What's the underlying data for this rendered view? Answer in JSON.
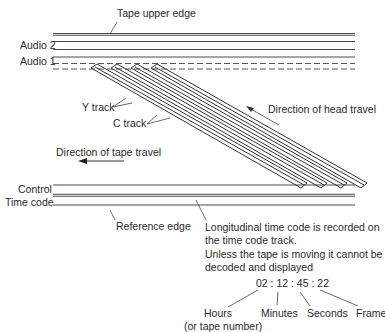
{
  "diagram": {
    "labels": {
      "tape_upper_edge": "Tape upper edge",
      "audio2": "Audio 2",
      "audio1": "Audio 1",
      "y_track": "Y  track",
      "c_track": "C  track",
      "head_travel": "Direction of head travel",
      "tape_travel": "Direction of tape travel",
      "control": "Control",
      "time_code": "Time code",
      "reference_edge": "Reference edge",
      "note_line1": "Longitudinal time code is recorded on",
      "note_line2": "the time code track.",
      "note_line3": "Unless the tape is moving it cannot be",
      "note_line4": "decoded and displayed",
      "timecode_value": "02 : 12 : 45 : 22",
      "hours": "Hours",
      "hours_sub": "(or tape number)",
      "minutes": "Minutes",
      "seconds": "Seconds",
      "frame": "Frame"
    },
    "colors": {
      "line": "#4a4a4a",
      "text": "#2a2a2a",
      "background": "#ffffff"
    },
    "helical_tracks": 4
  }
}
